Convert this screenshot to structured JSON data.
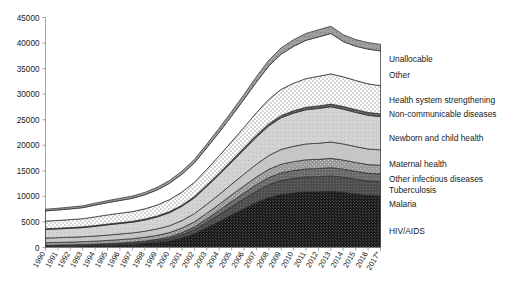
{
  "chart_data": {
    "type": "area",
    "stacked": true,
    "title": "",
    "xlabel": "",
    "ylabel": "",
    "ylim": [
      0,
      45000
    ],
    "ytick_step": 5000,
    "yticks": [
      "0",
      "5000",
      "10000",
      "15000",
      "20000",
      "25000",
      "30000",
      "35000",
      "40000",
      "45000"
    ],
    "grid": false,
    "legend_position": "right-inline",
    "categories": [
      "1990",
      "1991",
      "1992",
      "1993",
      "1994",
      "1995",
      "1996",
      "1997",
      "1998",
      "1999",
      "2000",
      "2001",
      "2002",
      "2003",
      "2004",
      "2005",
      "2006",
      "2007",
      "2008",
      "2009",
      "2010",
      "2011",
      "2012",
      "2013",
      "2014",
      "2015",
      "2016",
      "2017*"
    ],
    "series": [
      {
        "name": "HIV/AIDS",
        "fill": "hiv",
        "values": [
          200,
          230,
          260,
          300,
          360,
          420,
          500,
          600,
          760,
          980,
          1300,
          1900,
          2700,
          3900,
          5100,
          6400,
          7600,
          8800,
          9800,
          10400,
          10700,
          10900,
          10900,
          11000,
          10800,
          10500,
          10200,
          10100
        ]
      },
      {
        "name": "Malaria",
        "fill": "malaria",
        "values": [
          120,
          130,
          140,
          150,
          160,
          180,
          200,
          230,
          270,
          330,
          420,
          560,
          760,
          1000,
          1300,
          1600,
          1900,
          2200,
          2500,
          2700,
          2800,
          2900,
          2950,
          3000,
          2950,
          2850,
          2800,
          2800
        ]
      },
      {
        "name": "Tuberculosis",
        "fill": "tb",
        "values": [
          120,
          130,
          140,
          150,
          160,
          180,
          200,
          220,
          250,
          290,
          350,
          440,
          560,
          700,
          860,
          1000,
          1150,
          1300,
          1400,
          1500,
          1550,
          1580,
          1600,
          1620,
          1580,
          1550,
          1520,
          1500
        ]
      },
      {
        "name": "Other infectious diseases",
        "fill": "otherinf",
        "values": [
          500,
          510,
          520,
          540,
          560,
          600,
          640,
          680,
          720,
          780,
          850,
          920,
          1000,
          1100,
          1200,
          1300,
          1400,
          1500,
          1600,
          1700,
          1750,
          1780,
          1800,
          1820,
          1780,
          1740,
          1700,
          1700
        ]
      },
      {
        "name": "Maternal health",
        "fill": "maternal",
        "values": [
          900,
          920,
          950,
          960,
          1000,
          1050,
          1100,
          1120,
          1180,
          1250,
          1350,
          1450,
          1600,
          1750,
          1900,
          2100,
          2300,
          2500,
          2700,
          2900,
          3000,
          3100,
          3150,
          3200,
          3150,
          3100,
          3050,
          3000
        ]
      },
      {
        "name": "Newborn and child health",
        "fill": "newborn",
        "values": [
          1700,
          1720,
          1750,
          1800,
          1900,
          2000,
          2050,
          2100,
          2200,
          2350,
          2550,
          2800,
          3100,
          3500,
          3900,
          4300,
          4800,
          5300,
          5800,
          6200,
          6500,
          6700,
          6800,
          6900,
          6800,
          6700,
          6600,
          6500
        ]
      },
      {
        "name": "Non-communicable diseases",
        "fill": "ncd",
        "values": [
          130,
          130,
          140,
          140,
          150,
          150,
          160,
          170,
          180,
          190,
          200,
          220,
          240,
          260,
          290,
          320,
          350,
          380,
          410,
          440,
          460,
          480,
          500,
          520,
          530,
          540,
          550,
          560
        ]
      },
      {
        "name": "Health system strengthening",
        "fill": "hss",
        "values": [
          1500,
          1520,
          1560,
          1600,
          1700,
          1800,
          1850,
          1900,
          2000,
          2150,
          2350,
          2550,
          2800,
          3100,
          3400,
          3700,
          4000,
          4400,
          4800,
          5100,
          5400,
          5600,
          5800,
          5900,
          5800,
          5700,
          5600,
          5500
        ]
      },
      {
        "name": "Other",
        "fill": "other",
        "values": [
          2000,
          2050,
          2100,
          2150,
          2300,
          2400,
          2500,
          2600,
          2750,
          2950,
          3200,
          3500,
          3800,
          4200,
          4600,
          5000,
          5500,
          6000,
          6500,
          6900,
          7200,
          7500,
          7700,
          7900,
          6900,
          6700,
          6800,
          6800
        ]
      },
      {
        "name": "Unallocable",
        "fill": "unalloc",
        "values": [
          330,
          340,
          350,
          360,
          380,
          400,
          420,
          440,
          470,
          500,
          550,
          600,
          660,
          720,
          800,
          880,
          950,
          1050,
          1150,
          1250,
          1300,
          1350,
          1400,
          1440,
          1350,
          1300,
          1280,
          1280
        ]
      }
    ],
    "legend_entries": [
      {
        "label": "Unallocable",
        "y_px": 60
      },
      {
        "label": "Other",
        "y_px": 76
      },
      {
        "label": "Health system strengthening",
        "y_px": 101
      },
      {
        "label": "Non-communicable diseases",
        "y_px": 115
      },
      {
        "label": "Newborn and child health",
        "y_px": 139
      },
      {
        "label": "Maternal health",
        "y_px": 165
      },
      {
        "label": "Other infectious diseases",
        "y_px": 180
      },
      {
        "label": "Tuberculosis",
        "y_px": 191
      },
      {
        "label": "Malaria",
        "y_px": 205
      },
      {
        "label": "HIV/AIDS",
        "y_px": 232
      }
    ]
  }
}
